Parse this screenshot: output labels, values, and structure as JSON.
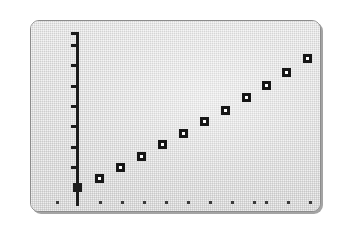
{
  "figure": {
    "kind": "scatter-plot-figure",
    "caption": "",
    "frame_background_color": "#dcdcdc",
    "page_background_color": "#ffffff",
    "ink_color": "#161616",
    "frame_border_color": "#8c8c8c",
    "frame_shadow_color": "#5a5a5a"
  },
  "axes": {
    "y_axis": {
      "name": "y-axis",
      "label": "",
      "line_color": "#1c1c1c",
      "top_px": 31,
      "bottom_px": 205,
      "x_px": 75,
      "tick_count": 7,
      "tick_positions_px": [
        43,
        63,
        84,
        104,
        124,
        145,
        165
      ],
      "has_top_cap": true,
      "origin_marker": {
        "name": "y-axis-origin-marker",
        "y_px": 185,
        "filled": true
      }
    },
    "x_axis": {
      "name": "x-axis",
      "label": "",
      "tick_color": "#3a3a3a",
      "tick_y_px": 200,
      "tick_count": 13,
      "tick_positions_px": [
        55,
        98,
        120,
        142,
        164,
        186,
        208,
        230,
        252,
        264,
        286,
        308
      ]
    }
  },
  "chart_data": {
    "type": "scatter",
    "title": "",
    "subtitle": "",
    "xlabel": "",
    "ylabel": "",
    "xlim": [
      0,
      12
    ],
    "ylim": [
      0,
      10
    ],
    "grid": false,
    "legend": null,
    "marker_style": "open-square",
    "series": [
      {
        "name": "series-1",
        "marker": "open-square",
        "color": "#161616",
        "x": [
          1,
          2,
          3,
          4,
          5,
          6,
          7,
          8,
          9,
          10,
          11
        ],
        "y": [
          1.25,
          1.85,
          2.45,
          3.1,
          3.7,
          4.35,
          5.0,
          5.7,
          6.4,
          7.15,
          8.0
        ],
        "points_px": [
          {
            "x": 98,
            "y": 177
          },
          {
            "x": 119,
            "y": 166
          },
          {
            "x": 140,
            "y": 155
          },
          {
            "x": 161,
            "y": 143
          },
          {
            "x": 182,
            "y": 132
          },
          {
            "x": 203,
            "y": 120
          },
          {
            "x": 224,
            "y": 109
          },
          {
            "x": 245,
            "y": 96
          },
          {
            "x": 265,
            "y": 84
          },
          {
            "x": 285,
            "y": 71
          },
          {
            "x": 306,
            "y": 57
          }
        ]
      }
    ]
  },
  "tick_marks": {
    "y_label": "y-axis-tick",
    "x_label": "x-axis-tick"
  }
}
